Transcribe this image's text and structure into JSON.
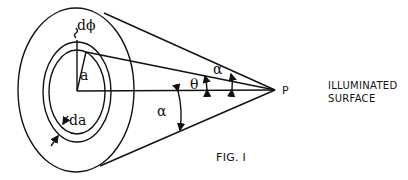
{
  "figure": {
    "caption": "FIG. I",
    "side_label_line1": "ILLUMINATED",
    "side_label_line2": "SURFACE"
  },
  "labels": {
    "d_phi": "dϕ",
    "a": "a",
    "da": "da",
    "theta": "θ",
    "alpha_upper": "α",
    "alpha_lower": "α",
    "point": "P"
  },
  "colors": {
    "stroke": "#111111",
    "background": "#ffffff"
  }
}
